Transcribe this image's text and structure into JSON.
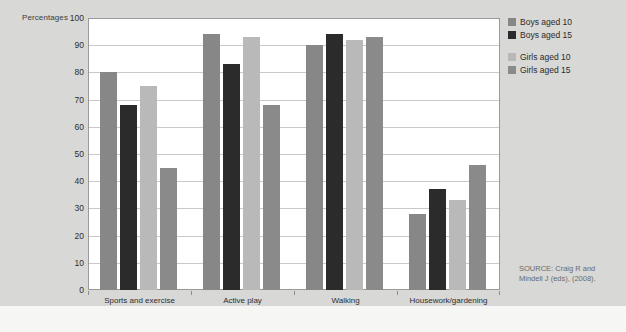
{
  "figure": {
    "background_color": "#d8d8d6",
    "plot_background_color": "#ffffff"
  },
  "y_axis_title": "Percentages",
  "source": {
    "line1": "SOURCE: Craig R and",
    "line2": "Mindell J (eds),  (2008)."
  },
  "legend": {
    "items": [
      {
        "label": "Boys aged 10",
        "color": "#878787"
      },
      {
        "label": "Boys aged 15",
        "color": "#2b2b2b"
      },
      {
        "label": "Girls aged 10",
        "color": "#b9b9b9"
      },
      {
        "label": "Girls aged 15",
        "color": "#8a8a8a"
      }
    ]
  },
  "chart_data": {
    "type": "bar",
    "title": "",
    "xlabel": "",
    "ylabel": "Percentages",
    "categories": [
      "Sports and exercise",
      "Active play",
      "Walking",
      "Housework/gardening"
    ],
    "series": [
      {
        "name": "Boys aged 10",
        "color": "#878787",
        "values": [
          80,
          94,
          90,
          28
        ]
      },
      {
        "name": "Boys aged 15",
        "color": "#2b2b2b",
        "values": [
          68,
          83,
          94,
          37
        ]
      },
      {
        "name": "Girls aged 10",
        "color": "#b9b9b9",
        "values": [
          75,
          93,
          92,
          33
        ]
      },
      {
        "name": "Girls aged 15",
        "color": "#8a8a8a",
        "values": [
          45,
          68,
          93,
          46
        ]
      }
    ],
    "ylim": [
      0,
      100
    ],
    "yticks": [
      0,
      10,
      20,
      30,
      40,
      50,
      60,
      70,
      80,
      90,
      100
    ],
    "ytick_labels": [
      "0",
      "10",
      "20",
      "30",
      "40",
      "50",
      "60",
      "70",
      "80",
      "90",
      "100"
    ],
    "grid": true,
    "grid_axis": "y",
    "legend_position": "right"
  }
}
